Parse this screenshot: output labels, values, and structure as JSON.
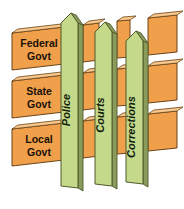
{
  "diagram": {
    "background_color": "#ffffff",
    "horizontal_bars": {
      "name": "levels-of-government",
      "face_color": "#F0A04B",
      "top_color": "#F8C88C",
      "edge_color": "#6B4418",
      "items": [
        {
          "id": "federal",
          "label_line1": "Federal",
          "label_line2": "Govt"
        },
        {
          "id": "state",
          "label_line1": "State",
          "label_line2": "Govt"
        },
        {
          "id": "local",
          "label_line1": "Local",
          "label_line2": "Govt"
        }
      ]
    },
    "vertical_pickets": {
      "name": "justice-system-components",
      "face_color": "#C5D98A",
      "side_color": "#8A9B5C",
      "edge_color": "#4F5A2B",
      "items": [
        {
          "id": "police",
          "label": "Police"
        },
        {
          "id": "courts",
          "label": "Courts"
        },
        {
          "id": "corrections",
          "label": "Corrections"
        }
      ]
    }
  }
}
